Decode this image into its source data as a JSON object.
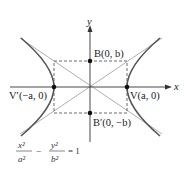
{
  "diagram": {
    "type": "hyperbola",
    "axes": {
      "x_label": "x",
      "y_label": "y"
    },
    "points": {
      "vertex_right": "V(a, 0)",
      "vertex_left": "V′(−a, 0)",
      "co_vertex_top": "B(0, b)",
      "co_vertex_bottom": "B′(0, −b)"
    },
    "equation": {
      "term1_num": "x²",
      "term1_den": "a²",
      "minus": "−",
      "term2_num": "y²",
      "term2_den": "b²",
      "equals": "= 1"
    },
    "colors": {
      "curve": "#555555",
      "axis": "#333333",
      "asymptote": "#888888",
      "dash": "#444444"
    }
  }
}
